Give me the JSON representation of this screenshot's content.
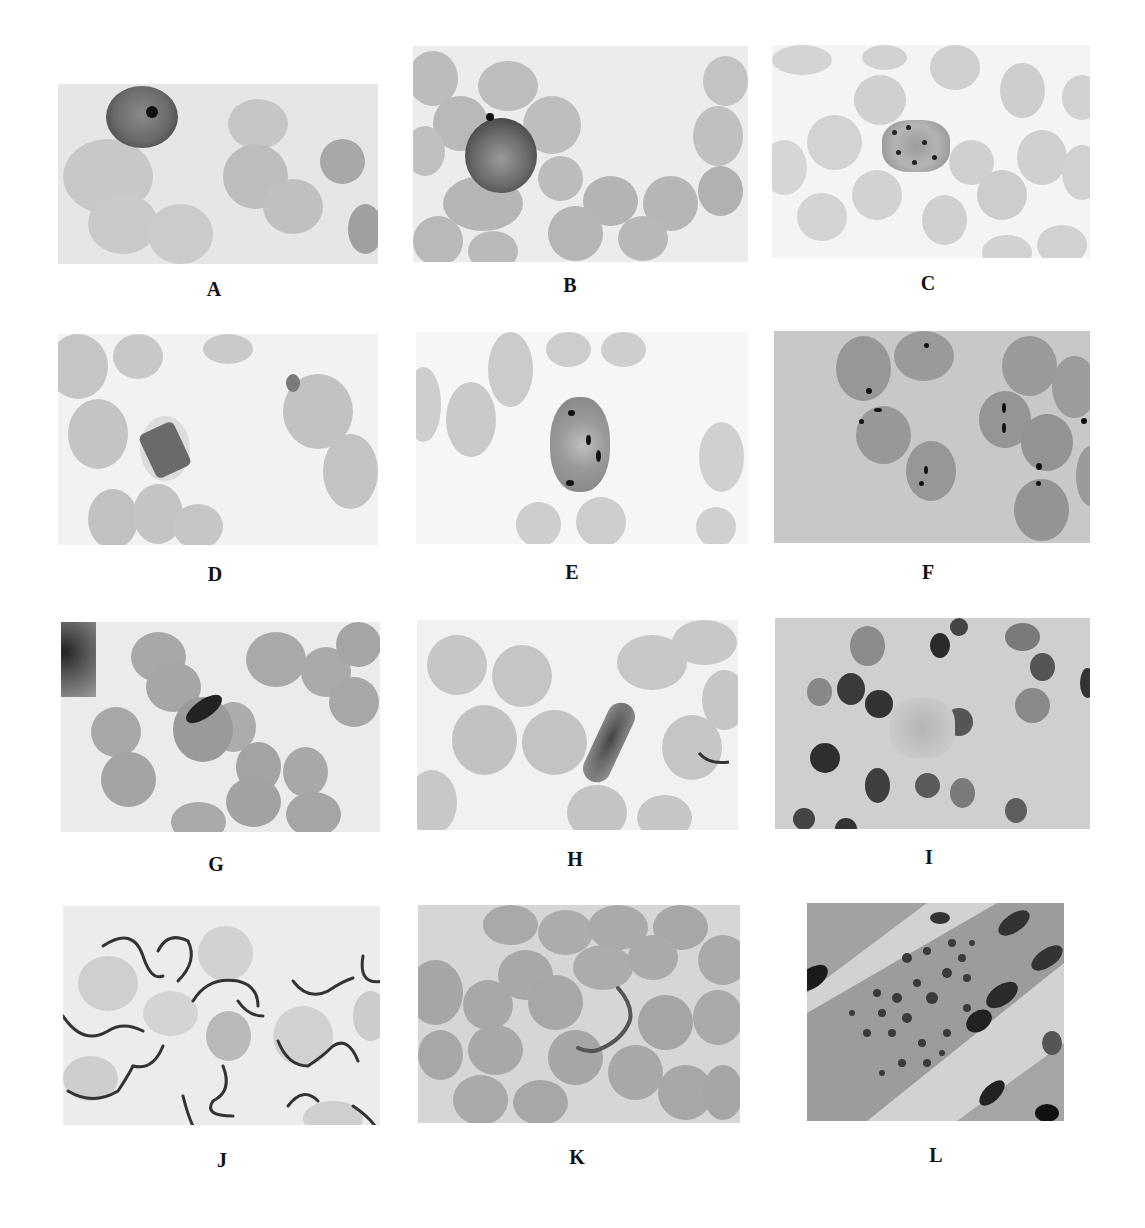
{
  "figure": {
    "panels": [
      {
        "id": "A",
        "label": "A",
        "x": 58,
        "y": 84,
        "w": 320,
        "h": 180,
        "lx": 214,
        "ly": 279,
        "bg": "#e6e6e6",
        "cell": "#bdbdbd"
      },
      {
        "id": "B",
        "label": "B",
        "x": 413,
        "y": 46,
        "w": 335,
        "h": 216,
        "lx": 570,
        "ly": 275,
        "bg": "#ececec",
        "cell": "#b8b8b8"
      },
      {
        "id": "C",
        "label": "C",
        "x": 772,
        "y": 45,
        "w": 318,
        "h": 213,
        "lx": 928,
        "ly": 273,
        "bg": "#f4f4f4",
        "cell": "#d0d0d0"
      },
      {
        "id": "D",
        "label": "D",
        "x": 58,
        "y": 334,
        "w": 320,
        "h": 211,
        "lx": 215,
        "ly": 564,
        "bg": "#f2f2f2",
        "cell": "#c4c4c4"
      },
      {
        "id": "E",
        "label": "E",
        "x": 416,
        "y": 332,
        "w": 332,
        "h": 212,
        "lx": 572,
        "ly": 562,
        "bg": "#f6f6f6",
        "cell": "#cacaca"
      },
      {
        "id": "F",
        "label": "F",
        "x": 774,
        "y": 331,
        "w": 316,
        "h": 212,
        "lx": 928,
        "ly": 562,
        "bg": "#c8c8c8",
        "cell": "#9a9a9a"
      },
      {
        "id": "G",
        "label": "G",
        "x": 61,
        "y": 622,
        "w": 319,
        "h": 210,
        "lx": 216,
        "ly": 854,
        "bg": "#ebebeb",
        "cell": "#a9a9a9"
      },
      {
        "id": "H",
        "label": "H",
        "x": 417,
        "y": 620,
        "w": 321,
        "h": 210,
        "lx": 575,
        "ly": 849,
        "bg": "#f1f1f1",
        "cell": "#c4c4c4"
      },
      {
        "id": "I",
        "label": "I",
        "x": 775,
        "y": 618,
        "w": 315,
        "h": 211,
        "lx": 929,
        "ly": 847,
        "bg": "#cfcfcf",
        "cell": "#5a5a5a"
      },
      {
        "id": "J",
        "label": "J",
        "x": 63,
        "y": 906,
        "w": 317,
        "h": 219,
        "lx": 222,
        "ly": 1150,
        "bg": "#ececec",
        "cell": "#c8c8c8"
      },
      {
        "id": "K",
        "label": "K",
        "x": 418,
        "y": 905,
        "w": 322,
        "h": 218,
        "lx": 577,
        "ly": 1147,
        "bg": "#d6d6d6",
        "cell": "#a8a8a8"
      },
      {
        "id": "L",
        "label": "L",
        "x": 807,
        "y": 903,
        "w": 257,
        "h": 218,
        "lx": 936,
        "ly": 1145,
        "bg": "#d2d2d2",
        "cell": "#8c8c8c"
      }
    ]
  }
}
